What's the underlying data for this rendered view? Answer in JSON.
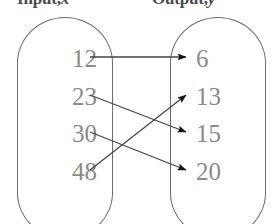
{
  "diagram": {
    "title_left": "Input, x",
    "title_right": "Output, y",
    "header_left_word": "Input,",
    "header_left_var": "x",
    "header_right_word": "Output,",
    "header_right_var": "y",
    "type": "mapping-diagram",
    "colors": {
      "number_text": "#8a8a8a",
      "oval_stroke": "#6b6b6b",
      "arrow_stroke": "#454545",
      "header_text": "#4a4a4a",
      "background": "#ffffff"
    },
    "input_set": {
      "label": "Input, x",
      "values": [
        "12",
        "23",
        "30",
        "48"
      ]
    },
    "output_set": {
      "label": "Output, y",
      "values": [
        "6",
        "13",
        "15",
        "20"
      ]
    },
    "mappings": [
      {
        "from": "12",
        "to": "6",
        "from_row": 0,
        "to_row": 0
      },
      {
        "from": "23",
        "to": "15",
        "from_row": 1,
        "to_row": 2
      },
      {
        "from": "30",
        "to": "20",
        "from_row": 2,
        "to_row": 3
      },
      {
        "from": "48",
        "to": "13",
        "from_row": 3,
        "to_row": 1
      }
    ]
  }
}
